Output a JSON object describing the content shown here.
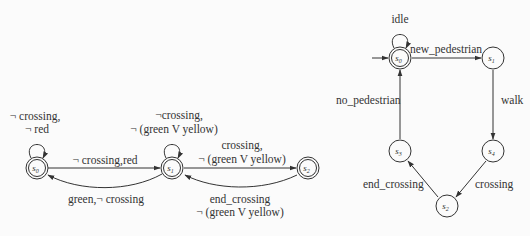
{
  "left_diagram": {
    "states": [
      {
        "id": "s0",
        "label": "s",
        "sub": "0",
        "accepting": true,
        "cx": 37,
        "cy": 168
      },
      {
        "id": "s1",
        "label": "s",
        "sub": "1",
        "accepting": true,
        "cx": 172,
        "cy": 168
      },
      {
        "id": "s2",
        "label": "s",
        "sub": "2",
        "accepting": true,
        "cx": 308,
        "cy": 168
      }
    ],
    "transitions": {
      "s0_self_line1": "¬ crossing,",
      "s0_self_line2": "¬ red",
      "s0_s1": "¬ crossing,red",
      "s1_s0": "green,¬ crossing",
      "s1_self_line1": "¬crossing,",
      "s1_self_line2": "¬ (green V yellow)",
      "s1_s2_line1": "crossing,",
      "s1_s2_line2": "¬ (green V yellow)",
      "s2_s1_line1": "end_crossing",
      "s2_s1_line2": "¬ (green V yellow)"
    }
  },
  "right_diagram": {
    "states": [
      {
        "id": "s0",
        "label": "s",
        "sub": "0",
        "accepting": true,
        "initial": true,
        "cx": 400,
        "cy": 58
      },
      {
        "id": "s1",
        "label": "s",
        "sub": "1",
        "accepting": false,
        "cx": 493,
        "cy": 58
      },
      {
        "id": "s4",
        "label": "s",
        "sub": "4",
        "accepting": false,
        "cx": 493,
        "cy": 151
      },
      {
        "id": "s2",
        "label": "s",
        "sub": "2",
        "accepting": false,
        "cx": 447,
        "cy": 206
      },
      {
        "id": "s3",
        "label": "s",
        "sub": "3",
        "accepting": false,
        "cx": 400,
        "cy": 151
      }
    ],
    "transitions": {
      "s0_self": "idle",
      "s0_s1": "new_pedestrian",
      "s1_s4": "walk",
      "s4_s2": "crossing",
      "s2_s3": "end_crossing",
      "s3_s0": "no_pedestrian"
    }
  }
}
